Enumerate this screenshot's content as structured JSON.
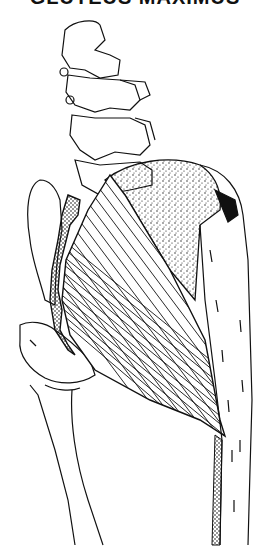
{
  "image": {
    "description": "Anatomical line drawing of the gluteus maximus muscle, posterior-lateral view, with lumbar vertebrae, sacrum/pelvis and femur",
    "title_partial": "GLUTEUS MAXIMUS",
    "title_visible": "cut off at top edge",
    "structures": [
      "lumbar-spine",
      "sacrum",
      "ilium",
      "gluteus-maximus",
      "iliotibial-tract",
      "femur",
      "greater-trochanter"
    ]
  },
  "colors": {
    "ink": "#111111",
    "background": "#ffffff"
  }
}
